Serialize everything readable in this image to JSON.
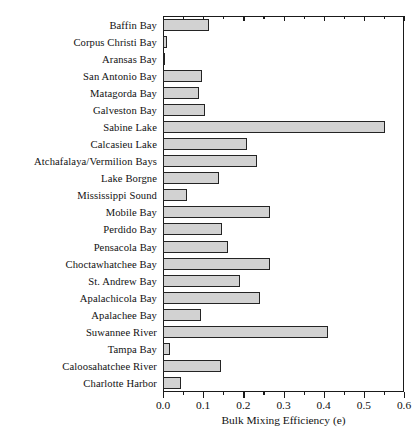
{
  "chart_data": {
    "type": "bar",
    "orientation": "horizontal",
    "title": "",
    "xlabel": "Bulk Mixing Efficiency (e)",
    "ylabel": "",
    "xlim": [
      0.0,
      0.6
    ],
    "xticks": [
      0.0,
      0.1,
      0.2,
      0.3,
      0.4,
      0.5,
      0.6
    ],
    "xtick_labels": [
      "0.0",
      "0.1",
      "0.2",
      "0.3",
      "0.4",
      "0.5",
      "0.6"
    ],
    "minor_tick_step": 0.05,
    "grid": false,
    "legend": null,
    "bar_fill_color": "#d2d2d2",
    "bar_edge_color": "#242424",
    "categories": [
      "Baffin Bay",
      "Corpus Christi Bay",
      "Aransas Bay",
      "San Antonio Bay",
      "Matagorda Bay",
      "Galveston Bay",
      "Sabine Lake",
      "Calcasieu Lake",
      "Atchafalaya/Vermilion Bays",
      "Lake Borgne",
      "Mississippi Sound",
      "Mobile Bay",
      "Perdido Bay",
      "Pensacola Bay",
      "Choctawhatchee Bay",
      "St. Andrew Bay",
      "Apalachicola Bay",
      "Apalachee Bay",
      "Suwannee River",
      "Tampa Bay",
      "Caloosahatchee River",
      "Charlotte Harbor"
    ],
    "values": [
      0.115,
      0.011,
      0.005,
      0.097,
      0.09,
      0.105,
      0.553,
      0.209,
      0.234,
      0.139,
      0.06,
      0.266,
      0.147,
      0.162,
      0.266,
      0.192,
      0.242,
      0.094,
      0.411,
      0.017,
      0.144,
      0.044
    ]
  }
}
